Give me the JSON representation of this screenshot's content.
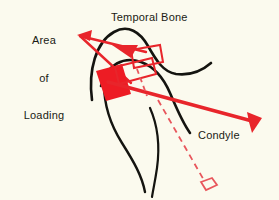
{
  "figure": {
    "title_present": false,
    "background_color": "#fbfaee",
    "bone_outline_color": "#141410",
    "accent_color": "#e8252b",
    "disc_fill_color": "#ed1c24",
    "dashed_color": "#e8565c"
  },
  "labels": {
    "area_of_loading": "Area\nof\nLoading",
    "area_of_loading_line1": "Area",
    "area_of_loading_line2": "of",
    "area_of_loading_line3": "Loading",
    "temporal_bone": "Temporal Bone",
    "condyle": "Condyle"
  },
  "annotations": {
    "loading_leader": "wedge-leader-to-disc",
    "loading_arrowhead": "arrowhead-pointing-left-to-text",
    "disc_arrowhead": "arrowhead-pointing-right-into-joint",
    "condyle_arrow": "thick-arrow-pointing-down-right",
    "translation_path": "dashed-line-to-translated-disc",
    "translated_disc": "hollow-diamond-outline"
  },
  "shapes": {
    "temporal_bone_curve": "S-curve articular eminence of temporal bone",
    "mandibular_condyle_curve": "rounded condyle head outline",
    "ramus_curve": "descending ramus outline",
    "articular_disc_filled": "solid red quadrilateral disc in loading zone",
    "disc_outline_rect": "rotated open red rectangle superior-posterior",
    "disc_outline_rect_2": "rotated open red rectangle second position"
  }
}
